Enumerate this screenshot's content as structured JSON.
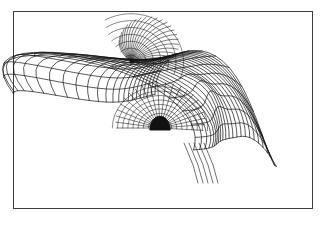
{
  "figure": {
    "kind": "3d-surface-wireframe",
    "title": "",
    "background_color": "#ffffff",
    "frame": {
      "visible": true,
      "border_color": "#3b3b41",
      "border_width_px": 1,
      "x": 13,
      "y": 11,
      "width": 300,
      "height": 198
    },
    "render_style": {
      "line_color": "#121212",
      "line_width_px": 0.7,
      "hidden_line_removal": false,
      "shading": "none",
      "vertex_markers": false
    }
  },
  "chart_data": {
    "type": "line",
    "title": "",
    "subtitle": "",
    "xlabel": "",
    "ylabel": "",
    "zlabel": "",
    "grid": false,
    "legend_position": "none",
    "tick_labels": {
      "x": [],
      "y": [],
      "z": []
    },
    "axis_ranges": {
      "x": [
        -1,
        1
      ],
      "y": [
        -1,
        1
      ],
      "z": [
        0,
        1
      ]
    },
    "annotations": [],
    "description": "Wireframe mesh of an intersecting vaulted shell surface: a main barrel vault arching from upper-left to lower-right, penetrated by a transverse cross vault whose groin lines converge at a dense crown node near the upper-left-of-center; a small dark arched opening is visible at the inner springing near the centre.",
    "surface": {
      "name": "groin-vault-shell",
      "mesh_rows": 14,
      "mesh_cols": 22,
      "u_range": [
        0,
        1
      ],
      "v_range": [
        0,
        1
      ],
      "features": [
        {
          "name": "main-barrel-vault",
          "role": "primary ruled arch surface",
          "pixel_extent": {
            "x": [
              128,
              272
            ],
            "y": [
              28,
              185
            ]
          }
        },
        {
          "name": "left-lobe-cross-vault",
          "role": "transverse intersecting vault wing",
          "pixel_extent": {
            "x": [
              66,
              150
            ],
            "y": [
              50,
              122
            ]
          }
        },
        {
          "name": "crown-convergence-node",
          "role": "groin apex where all generators meet",
          "pixel_position": {
            "x": 131,
            "y": 62
          }
        },
        {
          "name": "inner-arch-opening",
          "role": "dark arched void at inner springing",
          "pixel_position": {
            "x": 160,
            "y": 128
          }
        },
        {
          "name": "lower-fold-spike",
          "role": "downward-folding edge of skirt",
          "pixel_position": {
            "x": 208,
            "y": 183
          }
        }
      ]
    }
  }
}
